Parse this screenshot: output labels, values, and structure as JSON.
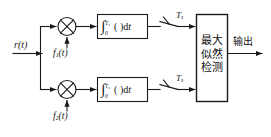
{
  "diagram": {
    "input": {
      "label": "r(t)",
      "name": "received-signal"
    },
    "branches": [
      {
        "id": "upper",
        "multiplier": {
          "glyph": "⊗",
          "name": "multiplier-upper"
        },
        "carrier": {
          "label": "f₁(t)",
          "base": "f",
          "subscript": "1",
          "arg": "(t)"
        },
        "integrator": {
          "lower_limit": "0",
          "upper_limit": "Tₛ",
          "upper_limit_base": "T",
          "upper_limit_sub": "s",
          "body": "(   )d",
          "differential": "t",
          "integral_sign": "∫"
        },
        "sampler": {
          "label": "Tₛ",
          "base": "T",
          "subscript": "s"
        }
      },
      {
        "id": "lower",
        "multiplier": {
          "glyph": "⊗",
          "name": "multiplier-lower"
        },
        "carrier": {
          "label": "f₂(t)",
          "base": "f",
          "subscript": "2",
          "arg": "(t)"
        },
        "integrator": {
          "lower_limit": "0",
          "upper_limit": "Tₛ",
          "upper_limit_base": "T",
          "upper_limit_sub": "s",
          "body": "(   )d",
          "differential": "t",
          "integral_sign": "∫"
        },
        "sampler": {
          "label": "Tₛ",
          "base": "T",
          "subscript": "s"
        }
      }
    ],
    "decision_block": {
      "lines": [
        "最大",
        "似然",
        "检测"
      ],
      "line1": "最大",
      "line2": "似然",
      "line3": "检测"
    },
    "output": {
      "label": "输出",
      "name": "output-signal"
    },
    "colors": {
      "stroke": "#1a1a1a",
      "background": "#ffffff",
      "text": "#111111"
    }
  }
}
